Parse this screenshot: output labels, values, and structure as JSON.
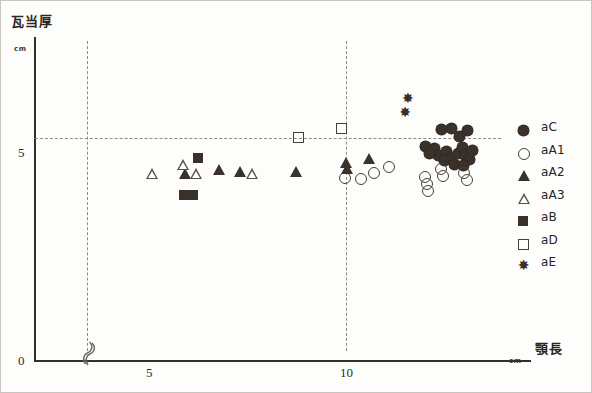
{
  "axes": {
    "y_title": "瓦当厚",
    "y_unit": "cm",
    "x_title": "顎長",
    "x_unit": "cm",
    "y_ticks": [
      "0",
      "5"
    ],
    "x_ticks": [
      "5",
      "10"
    ],
    "axis_break_icon": "axis-break-squiggle"
  },
  "legend": {
    "items": [
      {
        "label": "aC",
        "marker": "filled-circle"
      },
      {
        "label": "aA1",
        "marker": "open-circle"
      },
      {
        "label": "aA2",
        "marker": "filled-triangle"
      },
      {
        "label": "aA3",
        "marker": "open-triangle"
      },
      {
        "label": "aB",
        "marker": "filled-square"
      },
      {
        "label": "aD",
        "marker": "open-square"
      },
      {
        "label": "aE",
        "marker": "star"
      }
    ]
  },
  "chart_data": {
    "type": "scatter",
    "title": "",
    "xlabel": "顎長",
    "ylabel": "瓦当厚",
    "xunit": "cm",
    "yunit": "cm",
    "xlim": [
      4.0,
      13.0
    ],
    "ylim": [
      0,
      7.2
    ],
    "x_axis_break": true,
    "x_break_between": [
      0,
      4.0
    ],
    "grid": {
      "vertical_at": [
        5,
        10
      ],
      "horizontal_at": [
        5
      ],
      "style": "dashed"
    },
    "legend_position": "right",
    "series": [
      {
        "name": "aC",
        "marker": "filled-circle",
        "points": [
          [
            11.85,
            5.2
          ],
          [
            12.05,
            5.22
          ],
          [
            12.2,
            5.05
          ],
          [
            12.35,
            5.18
          ],
          [
            11.55,
            4.82
          ],
          [
            11.72,
            4.78
          ],
          [
            11.8,
            4.62
          ],
          [
            11.95,
            4.7
          ],
          [
            12.05,
            4.58
          ],
          [
            12.18,
            4.66
          ],
          [
            12.25,
            4.8
          ],
          [
            12.32,
            4.62
          ],
          [
            11.62,
            4.66
          ],
          [
            11.9,
            4.5
          ],
          [
            12.1,
            4.42
          ],
          [
            12.4,
            4.52
          ],
          [
            12.45,
            4.72
          ],
          [
            12.28,
            4.4
          ]
        ]
      },
      {
        "name": "aA1",
        "marker": "open-circle",
        "points": [
          [
            10.0,
            4.1
          ],
          [
            10.3,
            4.08
          ],
          [
            10.55,
            4.22
          ],
          [
            10.85,
            4.35
          ],
          [
            11.55,
            4.12
          ],
          [
            11.58,
            3.95
          ],
          [
            11.6,
            3.8
          ],
          [
            11.85,
            4.3
          ],
          [
            11.88,
            4.14
          ],
          [
            12.3,
            4.2
          ],
          [
            12.35,
            4.05
          ]
        ]
      },
      {
        "name": "aA2",
        "marker": "filled-triangle",
        "points": [
          [
            6.9,
            4.2
          ],
          [
            7.55,
            4.3
          ],
          [
            7.95,
            4.25
          ],
          [
            9.05,
            4.25
          ],
          [
            10.0,
            4.45
          ],
          [
            10.02,
            4.32
          ],
          [
            10.45,
            4.55
          ]
        ]
      },
      {
        "name": "aA3",
        "marker": "open-triangle",
        "points": [
          [
            6.25,
            4.22
          ],
          [
            6.85,
            4.42
          ],
          [
            7.1,
            4.22
          ],
          [
            8.2,
            4.22
          ]
        ]
      },
      {
        "name": "aB",
        "marker": "filled-square",
        "points": [
          [
            7.15,
            4.55
          ],
          [
            6.88,
            3.72
          ],
          [
            7.05,
            3.72
          ]
        ]
      },
      {
        "name": "aD",
        "marker": "open-square",
        "points": [
          [
            9.1,
            5.0
          ],
          [
            9.92,
            5.22
          ]
        ]
      },
      {
        "name": "aE",
        "marker": "star",
        "points": [
          [
            11.2,
            5.9
          ],
          [
            11.15,
            5.58
          ]
        ]
      }
    ]
  }
}
